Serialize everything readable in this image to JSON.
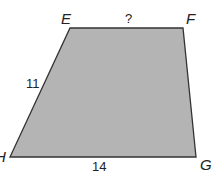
{
  "figure": {
    "shape": "trapezoid",
    "fill_color": "#b4b4b4",
    "stroke_color": "#333333",
    "vertices": {
      "E": {
        "label": "E",
        "x": 70,
        "y": 28
      },
      "F": {
        "label": "F",
        "x": 183,
        "y": 28
      },
      "G": {
        "label": "G",
        "x": 196,
        "y": 157
      },
      "H": {
        "label": "H",
        "x": 10,
        "y": 157
      }
    },
    "side_labels": {
      "EF": "?",
      "EH": "11",
      "HG": "14"
    }
  }
}
